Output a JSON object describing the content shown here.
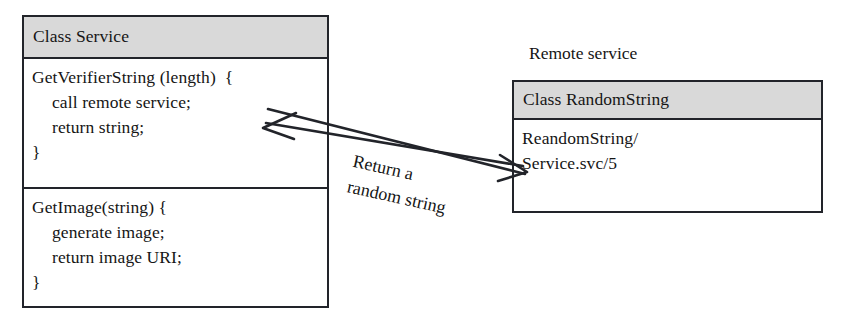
{
  "diagram": {
    "type": "uml-class-diagram",
    "background_color": "#ffffff",
    "stroke_color": "#22242a",
    "header_fill": "#d9d9d9",
    "text_color": "#151515"
  },
  "service_class": {
    "title": "Class Service",
    "methods": [
      {
        "name": "GetVerifierString",
        "lines": [
          "GetVerifierString (length)  {",
          "call remote service;",
          "return string;",
          "}"
        ]
      },
      {
        "name": "GetImage",
        "lines": [
          "GetImage(string) {",
          "generate image;",
          "return image URI;",
          "}"
        ]
      }
    ]
  },
  "remote_service": {
    "label": "Remote service",
    "class": {
      "title": "Class RandomString",
      "lines": [
        "ReandomString/",
        "Service.svc/5"
      ]
    }
  },
  "connector": {
    "caption_line_1": "Return a",
    "caption_line_2": "random string",
    "direction": "bidirectional",
    "left_arrow_name": "arrowhead-left",
    "right_arrow_name": "arrowhead-right"
  }
}
